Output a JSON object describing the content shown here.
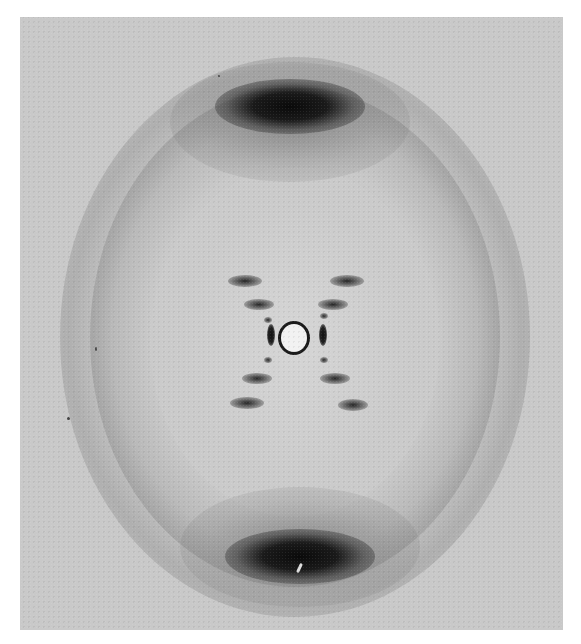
{
  "image": {
    "subject": "X-ray diffraction pattern",
    "palette": {
      "background": "#ffffff",
      "film": "#c9c9c9",
      "dark": "#111111",
      "beam_stop": "#f2f2f2"
    }
  }
}
